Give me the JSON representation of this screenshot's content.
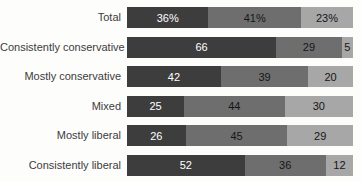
{
  "chart_data": {
    "type": "bar",
    "orientation": "horizontal",
    "stacked": true,
    "title": "",
    "xlabel": "",
    "ylabel": "",
    "legend": "none",
    "grid": false,
    "categories": [
      "Total",
      "Consistently conservative",
      "Mostly conservative",
      "Mixed",
      "Mostly liberal",
      "Consistently liberal"
    ],
    "rows": [
      {
        "label": "Total",
        "values": [
          "36%",
          "41%",
          "23%"
        ],
        "numeric": [
          36,
          41,
          23
        ]
      },
      {
        "label": "Consistently conservative",
        "values": [
          "66",
          "29",
          "5"
        ],
        "numeric": [
          66,
          29,
          5
        ]
      },
      {
        "label": "Mostly conservative",
        "values": [
          "42",
          "39",
          "20"
        ],
        "numeric": [
          42,
          39,
          20
        ]
      },
      {
        "label": "Mixed",
        "values": [
          "25",
          "44",
          "30"
        ],
        "numeric": [
          25,
          44,
          30
        ]
      },
      {
        "label": "Mostly liberal",
        "values": [
          "26",
          "45",
          "29"
        ],
        "numeric": [
          26,
          45,
          29
        ]
      },
      {
        "label": "Consistently liberal",
        "values": [
          "52",
          "36",
          "12"
        ],
        "numeric": [
          52,
          36,
          12
        ]
      }
    ],
    "segment_colors": [
      "#3d3d3d",
      "#6e6e6e",
      "#a7a7a7"
    ],
    "value_text_colors": [
      "#ffffff",
      "#161616",
      "#161616"
    ],
    "label_color": "#3c3c3c"
  }
}
